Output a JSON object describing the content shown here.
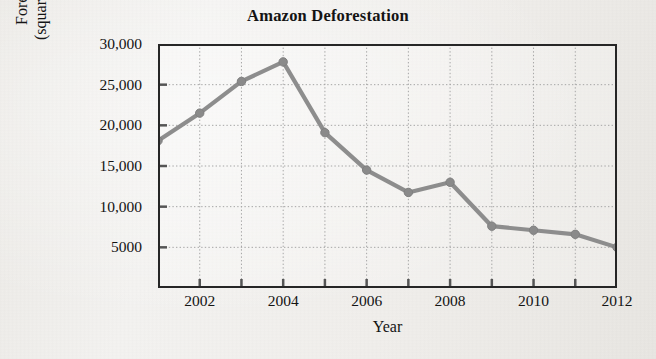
{
  "chart_data": {
    "type": "line",
    "title": "Amazon Deforestation",
    "xlabel": "Year",
    "ylabel": "Forest Cleared (square kilometers)",
    "ylabel_line1": "Forest Cleared",
    "ylabel_line2": "(square kilometers)",
    "x": [
      2001,
      2002,
      2003,
      2004,
      2005,
      2006,
      2007,
      2008,
      2009,
      2010,
      2011,
      2012
    ],
    "values": [
      18100,
      21500,
      25400,
      27800,
      19100,
      14500,
      11750,
      13000,
      7600,
      7100,
      6600,
      5000
    ],
    "xlim": [
      2001,
      2012
    ],
    "ylim": [
      0,
      30000
    ],
    "grid": true,
    "legend": "none",
    "series_color": "#6e6e6e",
    "axis_color": "#262626",
    "grid_color": "#8d8d8d",
    "background_color": "#f2f1ef",
    "x_tick_values": [
      2001,
      2002,
      2003,
      2004,
      2005,
      2006,
      2007,
      2008,
      2009,
      2010,
      2011,
      2012
    ],
    "x_tick_labels": [
      "",
      "2002",
      "",
      "2004",
      "",
      "2006",
      "",
      "2008",
      "",
      "2010",
      "",
      "2012"
    ],
    "y_tick_values": [
      5000,
      10000,
      15000,
      20000,
      25000,
      30000
    ],
    "y_tick_labels": [
      "5000",
      "10,000",
      "15,000",
      "20,000",
      "25,000",
      "30,000"
    ]
  }
}
